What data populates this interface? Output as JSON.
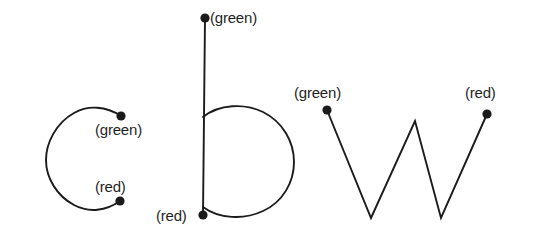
{
  "figure": {
    "background_color": "#ffffff",
    "stroke_color": "#1b1b1b",
    "dot_color": "#1b1b1b",
    "label_color": "#1f1f1f",
    "letters": [
      {
        "glyph": "c",
        "start_label": "(green)",
        "end_label": "(red)",
        "start_point": [
          121,
          116
        ],
        "end_point": [
          120,
          201
        ]
      },
      {
        "glyph": "b",
        "start_label": "(green)",
        "end_label": "(red)",
        "start_point": [
          205,
          18
        ],
        "end_point": [
          203,
          215
        ]
      },
      {
        "glyph": "w",
        "start_label": "(green)",
        "end_label": "(red)",
        "start_point": [
          327,
          110
        ],
        "end_point": [
          487,
          114
        ]
      }
    ],
    "labels": {
      "c_green": "(green)",
      "c_red": "(red)",
      "b_green": "(green)",
      "b_red": "(red)",
      "w_green": "(green)",
      "w_red": "(red)"
    }
  }
}
